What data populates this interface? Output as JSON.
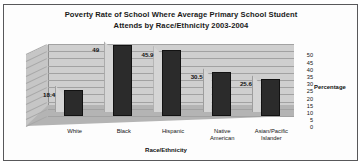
{
  "chart_data": {
    "type": "bar",
    "title": "Poverty Rate of School Where Average Primary School Student Attends by Race/Ethnicity 2003-2004",
    "title_line1": "Poverty Rate of School Where Average Primary School Student",
    "title_line2": "Attends by Race/Ethnicity 2003-2004",
    "categories": [
      "White",
      "Black",
      "Hispanic",
      "Native\nAmerican",
      "Asian/Pacific\nIslander"
    ],
    "values": [
      18.4,
      49,
      45.9,
      30.5,
      25.6
    ],
    "value_labels": [
      "18.4",
      "49",
      "45.9",
      "30.5",
      "25.6"
    ],
    "xlabel": "Race/Ethnicity",
    "ylabel": "Percentage",
    "ylim": [
      0,
      50
    ],
    "yticks": [
      50,
      45,
      40,
      35,
      30,
      25,
      20,
      15,
      10,
      5,
      0
    ],
    "ytick_labels": [
      "50",
      "45",
      "40",
      "35",
      "30",
      "25",
      "20",
      "15",
      "10",
      "5",
      "0"
    ],
    "grid": true,
    "legend": "none",
    "style": "3d-column",
    "series": [
      {
        "name": "Percentage",
        "values": [
          18.4,
          49,
          45.9,
          30.5,
          25.6
        ]
      }
    ],
    "colors": {
      "bar_front": "#2b2b2b",
      "bar_side": "#d5d5d5",
      "back_wall": "#cfcfcf",
      "floor": "#b4b4b4",
      "gridline": "#a2a2a2",
      "text": "#111111",
      "frame": "#58585a",
      "background": "#ffffff"
    }
  }
}
